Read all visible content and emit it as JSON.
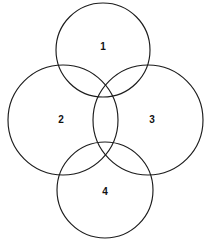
{
  "figure": {
    "type": "four-circle-venn-diagram",
    "background_color": "#ffffff",
    "stroke_color": "#1c1c1c",
    "label_color": "#111111",
    "width": 212,
    "height": 246
  },
  "chart_data": {
    "type": "diagram",
    "title": "",
    "subtitle": "",
    "xlabel": "",
    "ylabel": "",
    "legend": [],
    "annotations": [],
    "shape": "circle",
    "arrangement": "diamond-cross",
    "circle_count": 4,
    "circles": [
      {
        "label": "1",
        "position": "top",
        "cx": 103,
        "cy": 50,
        "r": 47
      },
      {
        "label": "2",
        "position": "left",
        "cx": 63,
        "cy": 120,
        "r": 55
      },
      {
        "label": "3",
        "position": "right",
        "cx": 148,
        "cy": 120,
        "r": 55
      },
      {
        "label": "4",
        "position": "bottom",
        "cx": 105,
        "cy": 190,
        "r": 48
      }
    ],
    "labels": [
      {
        "text": "1",
        "x": 103,
        "y": 47
      },
      {
        "text": "2",
        "x": 61,
        "y": 120
      },
      {
        "text": "3",
        "x": 152,
        "y": 120
      },
      {
        "text": "4",
        "x": 105,
        "y": 192
      }
    ],
    "intersection_points": [
      {
        "x": 105,
        "y": 96
      },
      {
        "x": 105,
        "y": 143
      }
    ]
  }
}
